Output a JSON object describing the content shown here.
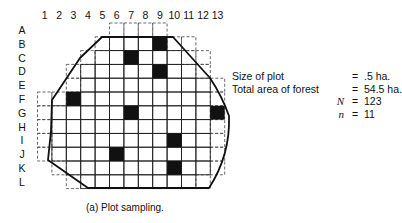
{
  "figure": {
    "column_labels": [
      "1",
      "2",
      "3",
      "4",
      "5",
      "6",
      "7",
      "8",
      "9",
      "10",
      "11",
      "12",
      "13"
    ],
    "row_labels": [
      "A",
      "B",
      "C",
      "D",
      "E",
      "F",
      "G",
      "H",
      "I",
      "J",
      "K",
      "L"
    ],
    "sampled_plots": [
      "B9",
      "C7",
      "D9",
      "F3",
      "G7",
      "G13",
      "H1",
      "I10",
      "J6",
      "K10",
      "L2"
    ],
    "caption": "(a)  Plot sampling."
  },
  "stats": {
    "rows": [
      {
        "label": "Size of plot",
        "eq": "=",
        "value": ".5 ha."
      },
      {
        "label": "Total area of forest",
        "eq": "=",
        "value": "54.5 ha."
      },
      {
        "label": "N",
        "eq": "=",
        "value": "123"
      },
      {
        "label": "n",
        "eq": "=",
        "value": "11"
      }
    ]
  },
  "colors": {
    "ink": "#111111",
    "grid": "#222222",
    "sample_fill": "#111111",
    "background": "#ffffff"
  }
}
